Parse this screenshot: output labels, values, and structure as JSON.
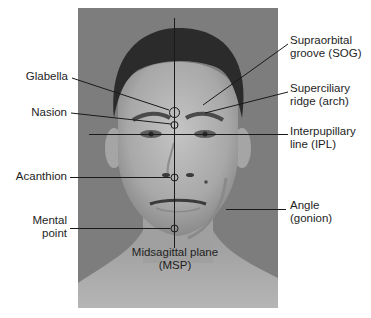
{
  "figure": {
    "type": "anatomical-landmarks-face",
    "photo": {
      "description": "frontal grayscale portrait of a young man",
      "background_color": "#7d7d7d"
    },
    "line_color": "#1a1a1a",
    "labels": {
      "supraorbital_groove": {
        "line1": "Supraorbital",
        "line2": "groove (SOG)"
      },
      "glabella": {
        "text": "Glabella"
      },
      "superciliary_ridge": {
        "line1": "Superciliary",
        "line2": "ridge (arch)"
      },
      "nasion": {
        "text": "Nasion"
      },
      "interpupillary_line": {
        "line1": "Interpupillary",
        "line2": "line (IPL)"
      },
      "acanthion": {
        "text": "Acanthion"
      },
      "angle": {
        "line1": "Angle",
        "line2": "(gonion)"
      },
      "mental_point": {
        "line1": "Mental",
        "line2": "point"
      },
      "midsagittal_plane": {
        "line1": "Midsagittal plane",
        "line2": "(MSP)"
      }
    }
  }
}
